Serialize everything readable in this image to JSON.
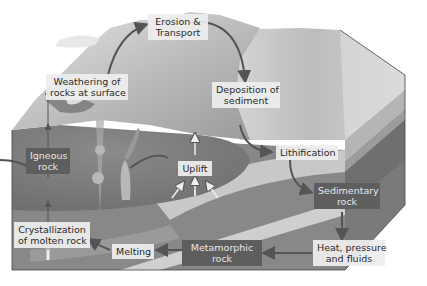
{
  "diagram": {
    "colors": {
      "background": "#ffffff",
      "mantle_block": "#8a8a8a",
      "magma_dome": "#7a7a7a",
      "sediment_top": "#cfcfcf",
      "light_layer": "#c4c4c4",
      "dark_label": "#5e5e5e",
      "light_label": "#eeeeee",
      "arrow": "#555555"
    },
    "labels": {
      "erosion": [
        "Erosion &",
        "Transport"
      ],
      "weathering": [
        "Weathering of",
        "rocks at surface"
      ],
      "deposition": [
        "Deposition of",
        "sediment"
      ],
      "lithification": [
        "Lithification"
      ],
      "sedimentary": [
        "Sedimentary",
        "rock"
      ],
      "heat": [
        "Heat, pressure",
        "and fluids"
      ],
      "metamorphic": [
        "Metamorphic",
        "rock"
      ],
      "melting": [
        "Melting"
      ],
      "crystallization": [
        "Crystallization",
        "of molten rock"
      ],
      "igneous": [
        "Igneous",
        "rock"
      ],
      "uplift": [
        "Uplift"
      ]
    }
  }
}
